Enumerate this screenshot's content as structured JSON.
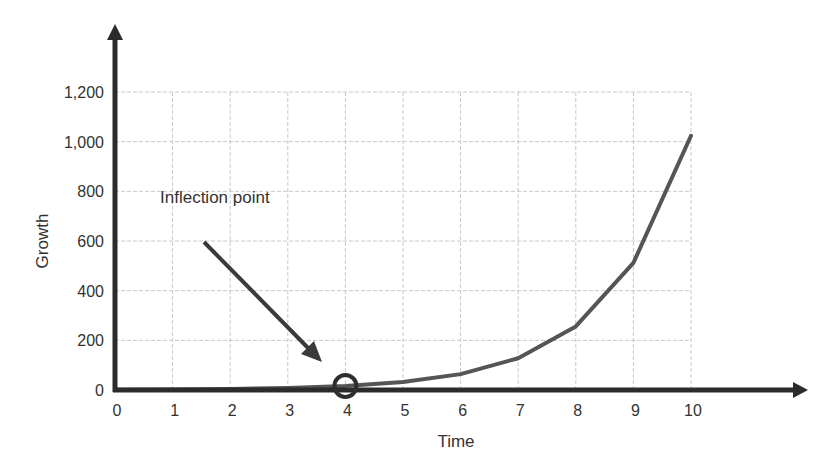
{
  "chart_data": {
    "type": "line",
    "title": "",
    "xlabel": "Time",
    "ylabel": "Growth",
    "x": [
      0,
      1,
      2,
      3,
      4,
      5,
      6,
      7,
      8,
      9,
      10
    ],
    "series": [
      {
        "name": "Growth",
        "values": [
          1,
          2,
          4,
          8,
          16,
          32,
          64,
          128,
          256,
          512,
          1024
        ],
        "color": "#555555"
      }
    ],
    "xticks": [
      "0",
      "1",
      "2",
      "3",
      "4",
      "5",
      "6",
      "7",
      "8",
      "9",
      "10"
    ],
    "yticks": [
      "0",
      "200",
      "400",
      "600",
      "800",
      "1,000",
      "1,200"
    ],
    "xlim": [
      0,
      12
    ],
    "ylim": [
      0,
      1200
    ],
    "grid": true,
    "legend": null,
    "annotations": [
      {
        "text": "Inflection point",
        "arrow_to": {
          "x": 4,
          "y": 16
        },
        "marker": "circle"
      }
    ]
  },
  "colors": {
    "axis": "#2b2b2b",
    "grid": "#c8c8c8",
    "line": "#555555",
    "arrow": "#3a3a3a"
  }
}
